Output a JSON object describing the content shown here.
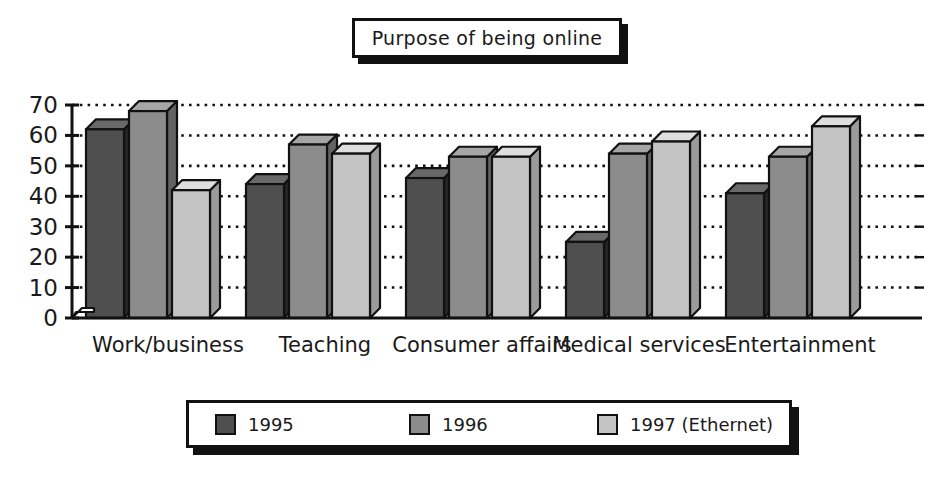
{
  "title": {
    "text": "Purpose of being online"
  },
  "chart_data": {
    "type": "bar",
    "title": "Purpose of being online",
    "xlabel": "",
    "ylabel": "",
    "ylim": [
      0,
      70
    ],
    "yticks": [
      0,
      10,
      20,
      30,
      40,
      50,
      60,
      70
    ],
    "ytick_labels": [
      "0",
      "10",
      "20",
      "30",
      "40",
      "50",
      "60",
      "70"
    ],
    "grid": true,
    "grid_style": "dotted-horizontal",
    "legend_position": "bottom",
    "style": "3d-bar",
    "categories": [
      "Work/business",
      "Teaching",
      "Consumer affairs",
      "Medical services",
      "Entertainment"
    ],
    "series": [
      {
        "name": "1995",
        "color": "#4f4f4f",
        "values": [
          62,
          44,
          46,
          25,
          41
        ]
      },
      {
        "name": "1996",
        "color": "#8c8c8c",
        "values": [
          68,
          57,
          53,
          54,
          53
        ]
      },
      {
        "name": "1997 (Ethernet)",
        "color": "#c4c4c4",
        "values": [
          42,
          54,
          53,
          58,
          63
        ]
      }
    ]
  },
  "legend": {
    "items": [
      {
        "label": "1995",
        "color": "#4f4f4f"
      },
      {
        "label": "1996",
        "color": "#8c8c8c"
      },
      {
        "label": "1997 (Ethernet)",
        "color": "#c4c4c4"
      }
    ]
  },
  "colors": {
    "ink": "#111111",
    "background": "#ffffff",
    "series_1995": "#4f4f4f",
    "series_1996": "#8c8c8c",
    "series_1997": "#c4c4c4"
  }
}
